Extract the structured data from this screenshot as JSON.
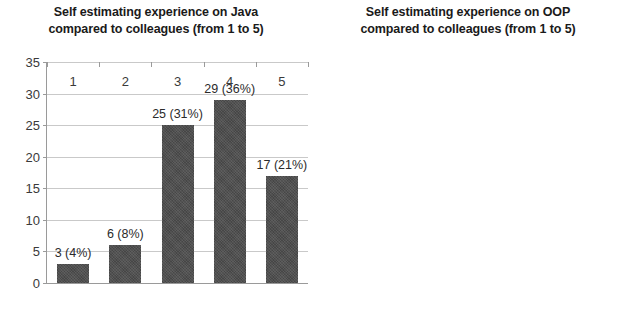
{
  "figure": {
    "background_color": "#ffffff",
    "bar_color": "#4d4d4d",
    "gridline_color": "#c9c9c9",
    "axis_color": "#9a9a9a",
    "text_color": "#3a3a3a"
  },
  "charts": [
    {
      "id": "java",
      "title": "Self estimating experience on Java\ncompared to colleagues (from 1 to 5)",
      "title_line1": "Self estimating experience on Java",
      "title_line2": "compared to colleagues (from 1 to 5)",
      "categories": [
        "1",
        "2",
        "3",
        "4",
        "5"
      ],
      "values": [
        3,
        6,
        25,
        29,
        17
      ],
      "data_labels": [
        "3 (4%)",
        "6 (8%)",
        "25 (31%)",
        "29 (36%)",
        "17 (21%)"
      ],
      "yticks": [
        "0",
        "5",
        "10",
        "15",
        "20",
        "25",
        "30",
        "35"
      ],
      "ytick_values": [
        0,
        5,
        10,
        15,
        20,
        25,
        30,
        35
      ],
      "ymin": 0,
      "ymax": 35
    },
    {
      "id": "oop",
      "title": "Self estimating experience on OOP\ncompared to colleagues (from 1 to 5)",
      "title_line1": "Self estimating experience on OOP",
      "title_line2": "compared to colleagues (from 1 to 5)",
      "categories": [
        "1",
        "2",
        "3",
        "4",
        "5"
      ],
      "values": [
        0,
        0,
        17,
        41,
        22
      ],
      "data_labels": [
        "0",
        "0",
        "17 (21%)",
        "41 (51%)",
        "22 (28%"
      ],
      "yticks": [
        "0",
        "5",
        "10",
        "15",
        "20",
        "25",
        "30",
        "35",
        "40",
        "45"
      ],
      "ytick_values": [
        0,
        5,
        10,
        15,
        20,
        25,
        30,
        35,
        40,
        45
      ],
      "ymin": 0,
      "ymax": 45
    }
  ],
  "chart_data": [
    {
      "type": "bar",
      "title": "Self estimating experience on Java compared to colleagues (from 1 to 5)",
      "categories": [
        "1",
        "2",
        "3",
        "4",
        "5"
      ],
      "values": [
        3,
        6,
        25,
        29,
        17
      ],
      "data_labels": [
        "3 (4%)",
        "6 (8%)",
        "25 (31%)",
        "29 (36%)",
        "17 (21%)"
      ],
      "percentages": [
        4,
        8,
        31,
        36,
        21
      ],
      "xlabel": "",
      "ylabel": "",
      "ylim": [
        0,
        35
      ],
      "ytick_step": 5,
      "grid": true,
      "legend": false,
      "series": [
        {
          "name": "Java self-estimate count",
          "values": [
            3,
            6,
            25,
            29,
            17
          ]
        }
      ]
    },
    {
      "type": "bar",
      "title": "Self estimating experience on OOP compared to colleagues (from 1 to 5)",
      "categories": [
        "1",
        "2",
        "3",
        "4",
        "5"
      ],
      "values": [
        0,
        0,
        17,
        41,
        22
      ],
      "data_labels": [
        "0",
        "0",
        "17 (21%)",
        "41 (51%)",
        "22 (28%"
      ],
      "percentages": [
        0,
        0,
        21,
        51,
        28
      ],
      "xlabel": "",
      "ylabel": "",
      "ylim": [
        0,
        45
      ],
      "ytick_step": 5,
      "grid": true,
      "legend": false,
      "series": [
        {
          "name": "OOP self-estimate count",
          "values": [
            0,
            0,
            17,
            41,
            22
          ]
        }
      ]
    }
  ]
}
